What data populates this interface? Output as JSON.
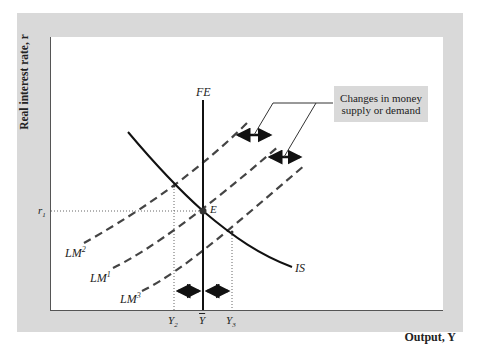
{
  "diagram": {
    "axes": {
      "y_label": "Real interest rate, r",
      "x_label": "Output, Y"
    },
    "curves": {
      "fe": "FE",
      "is": "IS",
      "lm1": "LM",
      "lm1_sup": "1",
      "lm2": "LM",
      "lm2_sup": "2",
      "lm3": "LM",
      "lm3_sup": "3"
    },
    "points": {
      "equilibrium": "E",
      "r1": "r",
      "r1_sub": "1"
    },
    "x_ticks": {
      "y2": "Y",
      "y2_sub": "2",
      "ybar": "Y",
      "y3": "Y",
      "y3_sub": "3"
    },
    "callout": {
      "line1": "Changes in money",
      "line2": "supply or demand"
    },
    "colors": {
      "panel": "#d9d9d9",
      "curve": "#111111",
      "dashed": "#444444"
    }
  }
}
